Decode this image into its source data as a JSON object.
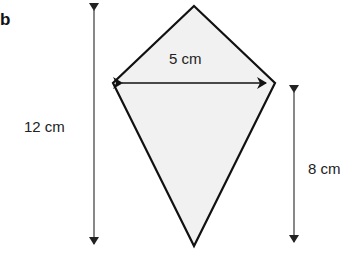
{
  "part_label": "b",
  "shape": {
    "type": "kite",
    "fill": "#f1f1f1",
    "stroke": "#111111",
    "vertices": {
      "top": [
        194,
        6
      ],
      "left": [
        113,
        83
      ],
      "right": [
        275,
        83
      ],
      "bottom": [
        194,
        246
      ]
    }
  },
  "dimensions": {
    "width_label": "5 cm",
    "total_height_label": "12 cm",
    "lower_height_label": "8 cm"
  },
  "colors": {
    "arrow": "#555555",
    "text": "#222222"
  }
}
